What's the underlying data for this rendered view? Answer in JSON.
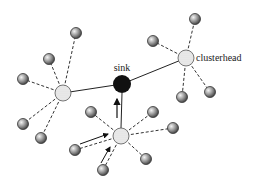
{
  "diagram": {
    "title": "",
    "labels": {
      "sink": "sink",
      "clusterhead": "clusterhead"
    },
    "colors": {
      "sink": "#111111",
      "node": "#8a8a8a",
      "clusterhead": "#eeeeee",
      "line": "#222222"
    },
    "sink": {
      "x": 122,
      "y": 84,
      "r": 9
    },
    "clusterheads": [
      {
        "id": "left",
        "x": 63,
        "y": 93,
        "r": 8,
        "members": [
          [
            76,
            33
          ],
          [
            49,
            59
          ],
          [
            23,
            79
          ],
          [
            23,
            124
          ],
          [
            41,
            138
          ]
        ]
      },
      {
        "id": "right",
        "x": 186,
        "y": 58,
        "r": 8,
        "members": [
          [
            195,
            19
          ],
          [
            153,
            41
          ],
          [
            182,
            97
          ],
          [
            210,
            92
          ]
        ]
      },
      {
        "id": "bottom",
        "x": 121,
        "y": 136,
        "r": 8,
        "members": [
          [
            91,
            112
          ],
          [
            153,
            112
          ],
          [
            173,
            128
          ],
          [
            146,
            159
          ],
          [
            103,
            170
          ],
          [
            75,
            150
          ]
        ]
      }
    ],
    "arrows": [
      {
        "from": [
          121,
          128
        ],
        "to": [
          121,
          96
        ],
        "desc": "clusterhead to sink"
      },
      {
        "from": [
          80,
          147
        ],
        "to": [
          112,
          135
        ],
        "desc": "member to clusterhead"
      },
      {
        "from": [
          105,
          166
        ],
        "to": [
          115,
          145
        ],
        "desc": "member to clusterhead"
      }
    ]
  }
}
